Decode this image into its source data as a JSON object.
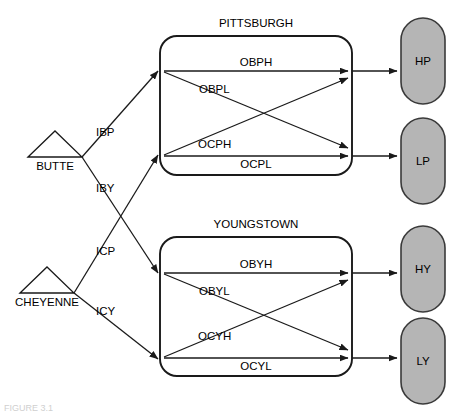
{
  "figure": {
    "caption": "FIGURE 3.1"
  },
  "colors": {
    "line": "#1a1a1a",
    "capsule_fill": "#b5b5b5",
    "capsule_stroke": "#3a3a3a",
    "background": "#ffffff"
  },
  "sources": [
    {
      "id": "butte",
      "label": "BUTTE"
    },
    {
      "id": "cheyenne",
      "label": "CHEYENNE"
    }
  ],
  "plants": [
    {
      "id": "pittsburgh",
      "title": "PITTSBURGH"
    },
    {
      "id": "youngstown",
      "title": "YOUNGSTOWN"
    }
  ],
  "destinations": [
    {
      "id": "hp",
      "label": "HP"
    },
    {
      "id": "lp",
      "label": "LP"
    },
    {
      "id": "hy",
      "label": "HY"
    },
    {
      "id": "ly",
      "label": "LY"
    }
  ],
  "inbound_arcs": [
    {
      "id": "ibp",
      "label": "IBP",
      "from": "BUTTE",
      "to": "PITTSBURGH"
    },
    {
      "id": "iby",
      "label": "IBY",
      "from": "BUTTE",
      "to": "YOUNGSTOWN"
    },
    {
      "id": "icp",
      "label": "ICP",
      "from": "CHEYENNE",
      "to": "PITTSBURGH"
    },
    {
      "id": "icy",
      "label": "ICY",
      "from": "CHEYENNE",
      "to": "YOUNGSTOWN"
    }
  ],
  "pittsburgh_arcs": [
    {
      "id": "obph",
      "label": "OBPH"
    },
    {
      "id": "obpl",
      "label": "OBPL"
    },
    {
      "id": "ocph",
      "label": "OCPH"
    },
    {
      "id": "ocpl",
      "label": "OCPL"
    }
  ],
  "youngstown_arcs": [
    {
      "id": "obyh",
      "label": "OBYH"
    },
    {
      "id": "obyl",
      "label": "OBYL"
    },
    {
      "id": "ocyh",
      "label": "OCYH"
    },
    {
      "id": "ocyl",
      "label": "OCYL"
    }
  ]
}
